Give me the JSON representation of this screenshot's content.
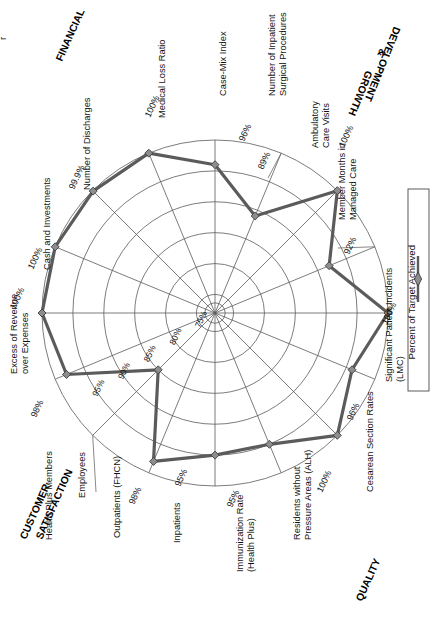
{
  "page": {
    "partial_text_top_left": "r",
    "background": "#ffffff"
  },
  "legend": {
    "label": "Percent of Target Achieved",
    "marker": "line-diamond-marker",
    "position": "right"
  },
  "categories": [
    {
      "id": "financial",
      "label": "FINANCIAL"
    },
    {
      "id": "growth",
      "label": "GROWTH\n&\nDEVELOPMENT",
      "line1": "GROWTH",
      "line2": "&",
      "line3": "DEVELOPMENT"
    },
    {
      "id": "quality",
      "label": "QUALITY"
    },
    {
      "id": "customer",
      "label": "CUSTOMER\nSATISFACTION",
      "line1": "CUSTOMER",
      "line2": "SATISFACTION"
    }
  ],
  "ring_labels": [
    "75%",
    "80%",
    "85%",
    "90%",
    "95%"
  ],
  "chart_data": {
    "type": "radar",
    "title": "",
    "series_name": "Percent of Target Achieved",
    "rmin": 72,
    "rmax": 100,
    "rticks": [
      75,
      80,
      85,
      90,
      95,
      100
    ],
    "grid": true,
    "legend_position": "right",
    "categories": [
      "Medical Loss Ratio",
      "Case-Mix Index",
      "Number of Inpatient Surgical Procedures",
      "Ambulatory Care Visits",
      "Member Months in Managed Care",
      "Significant Patient Incidents (LMC)",
      "Cesarean Section Rates",
      "Residents without Pressure Areas (ALH)",
      "Immunization Rate (Health Plus)",
      "Inpatients",
      "Outpatients (FHCN)",
      "Employees",
      "Health Plus Members",
      "Excess of Revenue over Expenses",
      "Cash and Investments",
      "Number of Discharges"
    ],
    "values": [
      100,
      96,
      89,
      100,
      92,
      100,
      96,
      100,
      95,
      95,
      98,
      85,
      98,
      100,
      100,
      99.9
    ],
    "value_labels": [
      "100%",
      "96%",
      "89%",
      "100%",
      "92%",
      "100%",
      "96%",
      "100%",
      "95%",
      "95%",
      "98%",
      "85%",
      "98%",
      "100%",
      "100%",
      "99.9%"
    ],
    "axis_groups": [
      {
        "group": "FINANCIAL",
        "axes": [
          "Medical Loss Ratio",
          "Number of Discharges",
          "Cash and Investments",
          "Excess of Revenue over Expenses"
        ]
      },
      {
        "group": "GROWTH & DEVELOPMENT",
        "axes": [
          "Case-Mix Index",
          "Number of Inpatient Surgical Procedures",
          "Ambulatory Care Visits",
          "Member Months in Managed Care"
        ]
      },
      {
        "group": "QUALITY",
        "axes": [
          "Significant Patient Incidents (LMC)",
          "Cesarean Section Rates",
          "Residents without Pressure Areas (ALH)",
          "Immunization Rate (Health Plus)"
        ]
      },
      {
        "group": "CUSTOMER SATISFACTION",
        "axes": [
          "Inpatients",
          "Outpatients (FHCN)",
          "Employees",
          "Health Plus Members"
        ]
      }
    ]
  },
  "axis_labels": {
    "medical_loss_ratio": {
      "name": "Medical Loss Ratio",
      "pct": "100%"
    },
    "case_mix_index": {
      "name": "Case-Mix Index",
      "pct": "96%"
    },
    "inpatient_surgical": {
      "line1": "Number of Inpatient",
      "line2": "Surgical Procedures",
      "pct": "89%"
    },
    "ambulatory": {
      "line1": "Ambulatory",
      "line2": "Care Visits",
      "pct": "100%"
    },
    "member_months": {
      "line1": "Member Months in",
      "line2": "Managed Care",
      "pct": "92%"
    },
    "patient_incidents": {
      "line1": "Significant Patient Incidents",
      "line2": "(LMC)",
      "pct": "100%"
    },
    "cesarean": {
      "name": "Cesarean Section Rates",
      "pct": "96%"
    },
    "pressure_areas": {
      "line1": "Residents without",
      "line2": "Pressure Areas (ALH)",
      "pct": "100%"
    },
    "immunization": {
      "line1": "Immunization Rate",
      "line2": "(Health Plus)",
      "pct": "95%"
    },
    "inpatients": {
      "name": "Inpatients",
      "pct": "95%"
    },
    "outpatients": {
      "name": "Outpatients (FHCN)",
      "pct": "98%"
    },
    "employees": {
      "name": "Employees",
      "pct": "85%"
    },
    "health_plus_members": {
      "name": "Health Plus Members",
      "pct": "98%"
    },
    "excess_revenue": {
      "line1": "Excess of Revenue",
      "line2": "over Expenses",
      "pct": "100%"
    },
    "cash_investments": {
      "name": "Cash and Investments",
      "pct": "100%"
    },
    "discharges": {
      "name": "Number of Discharges",
      "pct": "99.9%"
    }
  }
}
